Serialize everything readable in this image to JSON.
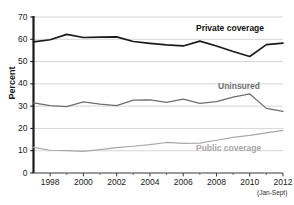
{
  "chart_data": {
    "type": "line",
    "title": "",
    "subtitle": "",
    "xlabel": "",
    "ylabel": "Percent",
    "ylim": [
      0,
      70
    ],
    "xlim": [
      1997,
      2012
    ],
    "grid": true,
    "legend_position": "inline-labels",
    "ytick_labels": [
      "0",
      "10",
      "20",
      "30",
      "40",
      "50",
      "60",
      "70"
    ],
    "ytick_values": [
      0,
      10,
      20,
      30,
      40,
      50,
      60,
      70
    ],
    "xtick_labels": [
      "1998",
      "2000",
      "2002",
      "2004",
      "2006",
      "2008",
      "2010",
      "2012"
    ],
    "xtick_values": [
      1998,
      2000,
      2002,
      2004,
      2006,
      2008,
      2010,
      2012
    ],
    "x": [
      1997,
      1998,
      1999,
      2000,
      2001,
      2002,
      2003,
      2004,
      2005,
      2006,
      2007,
      2008,
      2009,
      2010,
      2011,
      2012
    ],
    "annotations": [
      {
        "text": "(Jan-Sept)",
        "attached_to": "2012"
      }
    ],
    "series": [
      {
        "name": "Private coverage",
        "label": "Private coverage",
        "color": "#1a1a1a",
        "values": [
          58.8,
          59.8,
          62.2,
          60.8,
          61.0,
          61.1,
          59.0,
          58.2,
          57.5,
          57.0,
          59.2,
          57.0,
          54.5,
          52.3,
          57.6,
          58.3
        ]
      },
      {
        "name": "Uninsured",
        "label": "Uninsured",
        "color": "#6e6e6e",
        "values": [
          31.5,
          30.2,
          29.8,
          31.9,
          30.9,
          30.2,
          32.7,
          32.8,
          31.7,
          33.1,
          31.2,
          32.0,
          34.0,
          35.5,
          29.0,
          27.7
        ]
      },
      {
        "name": "Public coverage",
        "label": "Public coverage",
        "color": "#a8a8a8",
        "values": [
          11.5,
          10.2,
          10.0,
          9.7,
          10.5,
          11.4,
          12.0,
          12.7,
          13.7,
          13.3,
          13.4,
          14.7,
          16.0,
          16.9,
          18.0,
          19.1
        ]
      }
    ]
  },
  "axis": {
    "y_title": "Percent"
  }
}
